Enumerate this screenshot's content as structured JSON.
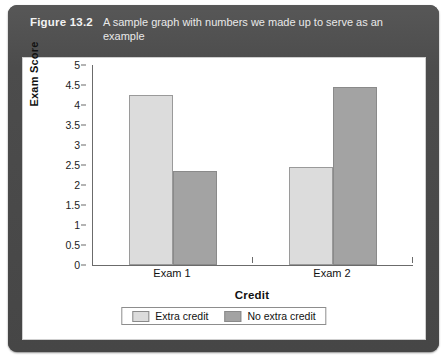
{
  "figure": {
    "label": "Figure 13.2",
    "caption": "A sample graph with numbers we made up to serve as an example"
  },
  "colors": {
    "panel_background": "#4a4a4a",
    "chart_background": "#ffffff",
    "series_light": "#dcdcdc",
    "series_dark": "#a3a3a3",
    "axis": "#6b6b6b",
    "text": "#111111"
  },
  "chart_data": {
    "type": "bar",
    "title": "",
    "xlabel": "Credit",
    "ylabel": "Exam Score",
    "categories": [
      "Exam 1",
      "Exam 2"
    ],
    "series": [
      {
        "name": "Extra credit",
        "values": [
          4.25,
          2.45
        ],
        "color": "#dcdcdc"
      },
      {
        "name": "No extra credit",
        "values": [
          2.35,
          4.45
        ],
        "color": "#a3a3a3"
      }
    ],
    "ylim": [
      0,
      5
    ],
    "yticks": [
      0,
      0.5,
      1,
      1.5,
      2,
      2.5,
      3,
      3.5,
      4,
      4.5,
      5
    ],
    "ytick_labels": [
      "0",
      "0.5",
      "1",
      "1.5",
      "2",
      "2.5",
      "3",
      "3.5",
      "4",
      "4.5",
      "5"
    ],
    "grid": false,
    "legend_position": "bottom",
    "legend": [
      "Extra credit",
      "No extra credit"
    ]
  }
}
